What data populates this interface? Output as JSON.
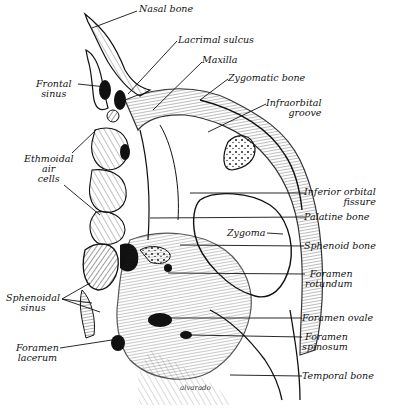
{
  "figure": {
    "type": "anatomical-line-drawing",
    "signature": "alvarado",
    "ink_color": "#111111",
    "background": "#ffffff"
  },
  "labels": {
    "nasal_bone": "Nasal bone",
    "lacrimal_sulcus": "Lacrimal sulcus",
    "maxilla": "Maxilla",
    "zygomatic_bone": "Zygomatic bone",
    "infraorbital_groove": [
      "Infraorbital",
      "groove"
    ],
    "frontal_sinus": [
      "Frontal",
      "sinus"
    ],
    "ethmoidal_air_cells": [
      "Ethmoidal",
      "air",
      "cells"
    ],
    "inferior_orbital_fissure": [
      "Inferior orbital",
      "fissure"
    ],
    "palatine_bone": "Palatine bone",
    "zygoma": "Zygoma",
    "sphenoid_bone": "Sphenoid bone",
    "foramen_rotundum": [
      "Foramen",
      "rotundum"
    ],
    "sphenoidal_sinus": [
      "Sphenoidal",
      "sinus"
    ],
    "foramen_ovale": "Foramen ovale",
    "foramen_spinosum": [
      "Foramen",
      "spinosum"
    ],
    "foramen_lacerum": [
      "Foramen",
      "lacerum"
    ],
    "temporal_bone": "Temporal bone"
  }
}
